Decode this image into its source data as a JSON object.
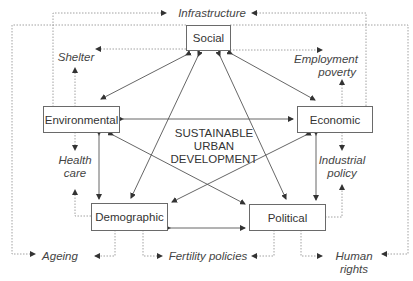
{
  "center": {
    "line1": "SUSTAINABLE",
    "line2": "URBAN",
    "line3": "DEVELOPMENT"
  },
  "dimensions": {
    "social": "Social",
    "environmental": "Environmental",
    "economic": "Economic",
    "demographic": "Demographic",
    "political": "Political"
  },
  "outcomes": {
    "infrastructure": "Infrastructure",
    "shelter": "Shelter",
    "employment_line1": "Employment",
    "employment_line2": "poverty",
    "health_line1": "Health",
    "health_line2": "care",
    "industrial_line1": "Industrial",
    "industrial_line2": "policy",
    "ageing": "Ageing",
    "fertility": "Fertility policies",
    "human_line1": "Human",
    "human_line2": "rights"
  },
  "colors": {
    "solid_line": "#555555",
    "dotted_line": "#888888",
    "box_border": "#6a6a6a"
  }
}
